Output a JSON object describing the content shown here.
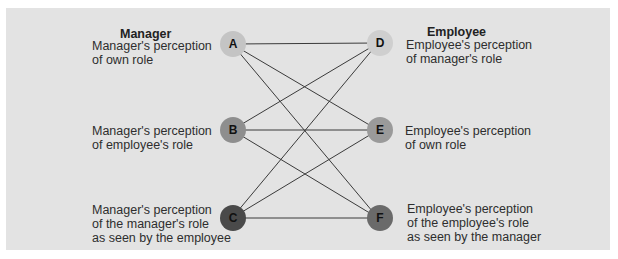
{
  "diagram": {
    "headings": {
      "left": "Manager",
      "right": "Employee"
    },
    "nodes": {
      "A": {
        "id": "A",
        "label": "Manager's perception\nof own role",
        "color": "#c4c4c4",
        "shadow": "#a9a9a9"
      },
      "B": {
        "id": "B",
        "label": "Manager's perception\nof employee's role",
        "color": "#8e8e8e",
        "shadow": "#6f6f6f"
      },
      "C": {
        "id": "C",
        "label": "Manager's perception\nof the manager's role\nas seen by the employee",
        "color": "#4a4a4a",
        "shadow": "#1a1a1a"
      },
      "D": {
        "id": "D",
        "label": "Employee's perception\nof manager's role",
        "color": "#cfcfcf",
        "shadow": "#b0b0b0"
      },
      "E": {
        "id": "E",
        "label": "Employee's perception\nof own role",
        "color": "#9a9a9a",
        "shadow": "#7a7a7a"
      },
      "F": {
        "id": "F",
        "label": "Employee's perception\nof the employee's role\nas seen by the manager",
        "color": "#6a6a6a",
        "shadow": "#222222"
      }
    },
    "edges": [
      [
        "A",
        "D"
      ],
      [
        "A",
        "E"
      ],
      [
        "A",
        "F"
      ],
      [
        "B",
        "D"
      ],
      [
        "B",
        "E"
      ],
      [
        "B",
        "F"
      ],
      [
        "C",
        "D"
      ],
      [
        "C",
        "E"
      ],
      [
        "C",
        "F"
      ]
    ],
    "colors": {
      "panel_bg": "#e3e3e3",
      "line": "#3a3a3a"
    }
  }
}
